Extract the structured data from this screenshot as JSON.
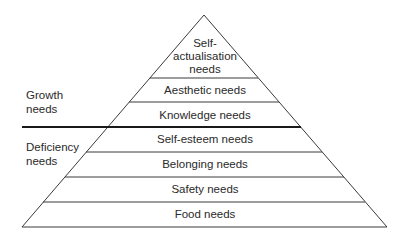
{
  "diagram": {
    "type": "pyramid",
    "levels": [
      {
        "label_lines": [
          "Self-",
          "actualisation",
          "needs"
        ],
        "group": "growth"
      },
      {
        "label": "Aesthetic needs",
        "group": "growth"
      },
      {
        "label": "Knowledge needs",
        "group": "growth"
      },
      {
        "label": "Self-esteem needs",
        "group": "deficiency"
      },
      {
        "label": "Belonging needs",
        "group": "deficiency"
      },
      {
        "label": "Safety needs",
        "group": "deficiency"
      },
      {
        "label": "Food needs",
        "group": "deficiency"
      }
    ],
    "groups": {
      "growth": {
        "label_lines": [
          "Growth",
          "needs"
        ]
      },
      "deficiency": {
        "label_lines": [
          "Deficiency",
          "needs"
        ]
      }
    },
    "colors": {
      "line": "#3a3a3a",
      "divider": "#1a1a1a",
      "text": "#2a2a2a",
      "background": "#ffffff"
    }
  }
}
